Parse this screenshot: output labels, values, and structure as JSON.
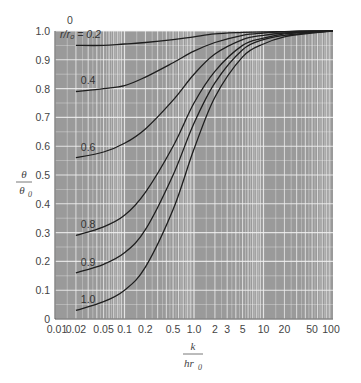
{
  "chart_data": {
    "type": "line",
    "title": "",
    "xlabel": "k / h r0",
    "xlabel_num": "k",
    "xlabel_den": "hr",
    "xlabel_den_sub": "0",
    "ylabel_num": "θ",
    "ylabel_den": "θ",
    "ylabel_den_sub": "0",
    "xscale": "log",
    "xlim": [
      0.01,
      100
    ],
    "ylim": [
      0,
      1.0
    ],
    "grid": true,
    "x_ticks": [
      "0.01",
      "0.02",
      "0.05",
      "0.1",
      "0.2",
      "0.5",
      "1.0",
      "2",
      "3",
      "5",
      "10",
      "20",
      "50",
      "100"
    ],
    "x_tick_values": [
      0.01,
      0.02,
      0.05,
      0.1,
      0.2,
      0.5,
      1.0,
      2,
      3,
      5,
      10,
      20,
      50,
      100
    ],
    "y_ticks": [
      "0",
      "0.1",
      "0.2",
      "0.3",
      "0.4",
      "0.5",
      "0.6",
      "0.7",
      "0.8",
      "0.9",
      "1.0"
    ],
    "y_tick_values": [
      0,
      0.1,
      0.2,
      0.3,
      0.4,
      0.5,
      0.6,
      0.7,
      0.8,
      0.9,
      1.0
    ],
    "top_label": "0",
    "legend_param": "r/r0",
    "x": [
      0.02,
      0.05,
      0.1,
      0.2,
      0.5,
      1.0,
      2,
      5,
      10,
      20,
      50,
      100
    ],
    "series": [
      {
        "name": "0.2",
        "label": "r/r₀ = 0.2",
        "values": [
          0.95,
          0.95,
          0.955,
          0.96,
          0.97,
          0.98,
          0.99,
          0.995,
          0.997,
          0.998,
          1.0,
          1.0
        ]
      },
      {
        "name": "0.4",
        "label": "0.4",
        "values": [
          0.79,
          0.8,
          0.81,
          0.84,
          0.89,
          0.93,
          0.96,
          0.985,
          0.993,
          0.997,
          1.0,
          1.0
        ]
      },
      {
        "name": "0.6",
        "label": "0.6",
        "values": [
          0.56,
          0.58,
          0.61,
          0.66,
          0.76,
          0.85,
          0.92,
          0.97,
          0.985,
          0.993,
          0.998,
          1.0
        ]
      },
      {
        "name": "0.8",
        "label": "0.8",
        "values": [
          0.29,
          0.32,
          0.36,
          0.44,
          0.6,
          0.75,
          0.86,
          0.95,
          0.975,
          0.99,
          0.997,
          1.0
        ]
      },
      {
        "name": "0.9",
        "label": "0.9",
        "values": [
          0.16,
          0.19,
          0.23,
          0.31,
          0.5,
          0.68,
          0.82,
          0.935,
          0.97,
          0.985,
          0.995,
          1.0
        ]
      },
      {
        "name": "1.0",
        "label": "1.0",
        "values": [
          0.03,
          0.06,
          0.1,
          0.18,
          0.38,
          0.59,
          0.77,
          0.91,
          0.955,
          0.98,
          0.993,
          1.0
        ]
      }
    ],
    "label_positions": [
      {
        "series": "0.2",
        "x": 0.2,
        "y": 0.99,
        "text": "r/r₀ = 0.2"
      },
      {
        "series": "0.4",
        "x": 0.022,
        "y": 0.815,
        "text": "0.4"
      },
      {
        "series": "0.6",
        "x": 0.022,
        "y": 0.585,
        "text": "0.6"
      },
      {
        "series": "0.8",
        "x": 0.022,
        "y": 0.315,
        "text": "0.8"
      },
      {
        "series": "0.9",
        "x": 0.022,
        "y": 0.185,
        "text": "0.9"
      },
      {
        "series": "1.0",
        "x": 0.022,
        "y": 0.055,
        "text": "1.0"
      }
    ],
    "colors": {
      "plot_bg": "#9a9a9a",
      "grid": "#f2f2f2",
      "curve": "#1e1e1e",
      "text": "#444444"
    }
  }
}
